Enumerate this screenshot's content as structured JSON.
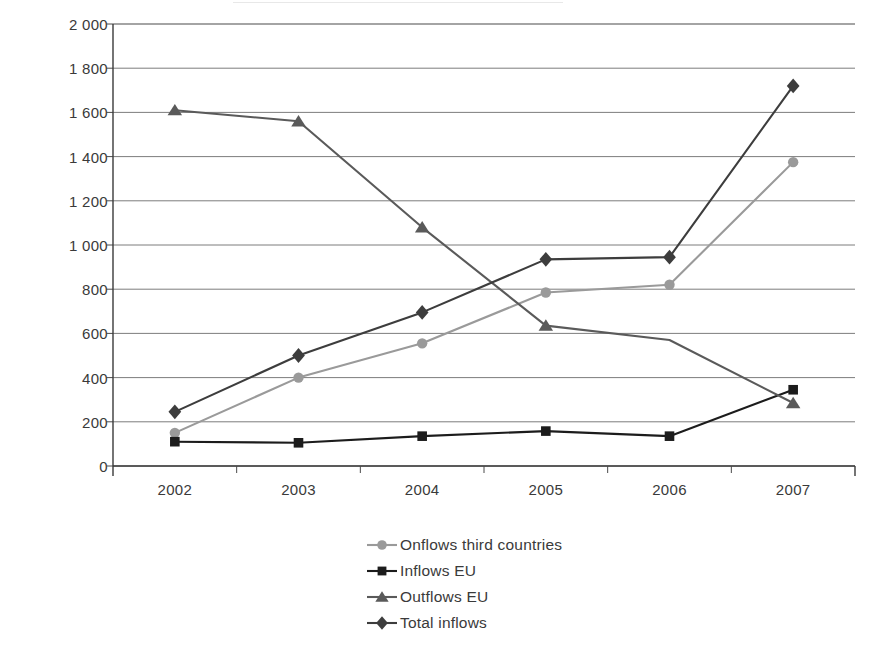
{
  "chart_data": {
    "type": "line",
    "title": "",
    "xlabel": "",
    "ylabel": "Numbers",
    "categories": [
      "2002",
      "2003",
      "2004",
      "2005",
      "2006",
      "2007"
    ],
    "ylim": [
      0,
      2000
    ],
    "ytick_labels": [
      "0",
      "200",
      "400",
      "600",
      "800",
      "1 000",
      "1 200",
      "1 400",
      "1 600",
      "1 800",
      "2 000"
    ],
    "ytick_values": [
      0,
      200,
      400,
      600,
      800,
      1000,
      1200,
      1400,
      1600,
      1800,
      2000
    ],
    "grid": true,
    "legend_position": "bottom-center",
    "series": [
      {
        "name": "Onflows third countries",
        "marker": "circle",
        "color": "#9a9a9a",
        "values": [
          150,
          400,
          555,
          785,
          820,
          1375
        ]
      },
      {
        "name": "Inflows EU",
        "marker": "square",
        "color": "#1c1c1c",
        "values": [
          110,
          105,
          135,
          158,
          135,
          345
        ]
      },
      {
        "name": "Outflows EU",
        "marker": "triangle",
        "color": "#5a5a5a",
        "values": [
          1610,
          1560,
          1080,
          635,
          570,
          285
        ]
      },
      {
        "name": "Total inflows",
        "marker": "diamond",
        "color": "#3d3d3d",
        "values": [
          245,
          500,
          695,
          935,
          945,
          1720
        ]
      }
    ]
  },
  "axis": {
    "y_title": "Numbers"
  }
}
